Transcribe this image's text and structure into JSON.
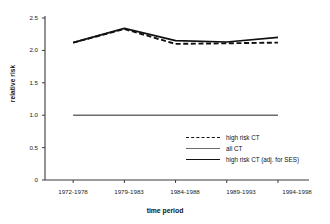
{
  "chart_data": {
    "type": "line",
    "title": "",
    "xlabel": "time period",
    "ylabel": "relative risk",
    "categories": [
      "1972-1978",
      "1979-1983",
      "1984-1988",
      "1989-1993",
      "1994-1998"
    ],
    "yticks": [
      "0",
      "0.5",
      "1.0",
      "1.5",
      "2.0",
      "2.5"
    ],
    "ylim": [
      0,
      2.5
    ],
    "grid": false,
    "legend_position": "inside-lower-right",
    "series": [
      {
        "name": "high risk CT",
        "style": "dashed",
        "color": "#111111",
        "values": [
          2.12,
          2.33,
          2.1,
          2.11,
          2.12
        ]
      },
      {
        "name": "all CT",
        "style": "solid-thin",
        "color": "#6b6b6b",
        "values": [
          1.0,
          1.0,
          1.0,
          1.0,
          1.0
        ]
      },
      {
        "name": "high risk CT (adj. for SES)",
        "style": "solid-thick",
        "color": "#111111",
        "values": [
          2.12,
          2.34,
          2.15,
          2.13,
          2.2
        ]
      }
    ]
  },
  "axis": {
    "y_label": "relative risk",
    "x_label": "time period",
    "y_tick_0": "0",
    "y_tick_1": "0.5",
    "y_tick_2": "1.0",
    "y_tick_3": "1.5",
    "y_tick_4": "2.0",
    "y_tick_5": "2.5",
    "x_tick_0": "1972-1978",
    "x_tick_1": "1979-1983",
    "x_tick_2": "1984-1988",
    "x_tick_3": "1989-1993",
    "x_tick_4": "1994-1998"
  },
  "legend": {
    "item_0": "high risk CT",
    "item_1": "all CT",
    "item_2": "high risk CT (adj. for SES)"
  }
}
